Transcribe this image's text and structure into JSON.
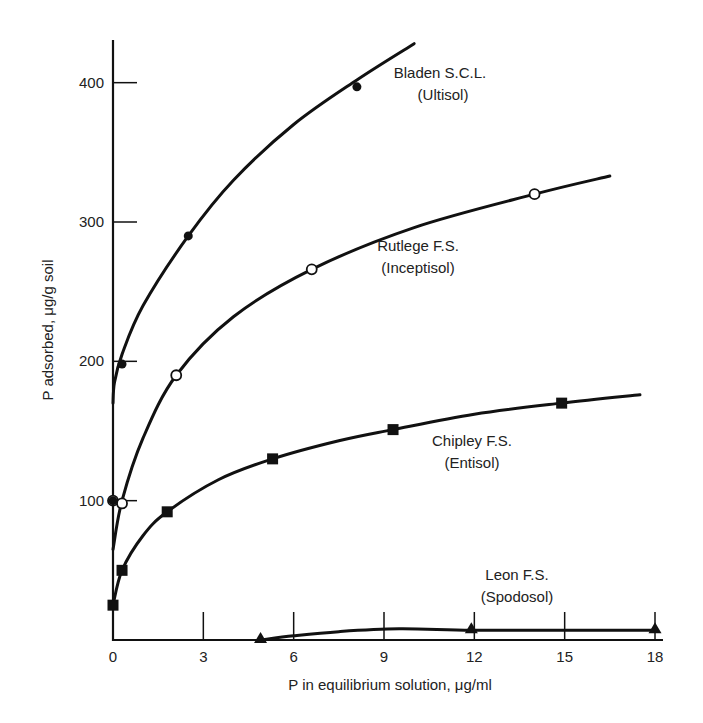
{
  "chart_data": {
    "type": "line",
    "title": "",
    "xlabel": "P in equilibrium solution, μg/ml",
    "ylabel": "P adsorbed, μg/g soil",
    "xlim": [
      0,
      18
    ],
    "ylim": [
      0,
      430
    ],
    "x_ticks": [
      0,
      3,
      6,
      9,
      12,
      15,
      18
    ],
    "y_ticks": [
      100,
      200,
      300,
      400
    ],
    "grid": false,
    "legend": "inline labels next to curves",
    "series": [
      {
        "name": "Bladen S.C.L.",
        "subtitle": "(Ultisol)",
        "marker": "filled-circle",
        "points": [
          [
            0.3,
            198
          ],
          [
            2.5,
            290
          ],
          [
            8.1,
            397
          ]
        ],
        "curve": [
          [
            0,
            170
          ],
          [
            0.05,
            185
          ],
          [
            0.3,
            205
          ],
          [
            1,
            240
          ],
          [
            2.5,
            290
          ],
          [
            4,
            330
          ],
          [
            6,
            370
          ],
          [
            8.1,
            402
          ],
          [
            10,
            428
          ]
        ]
      },
      {
        "name": "Rutlege F.S.",
        "subtitle": "(Inceptisol)",
        "marker": "open-circle",
        "points": [
          [
            0,
            100
          ],
          [
            0.3,
            98
          ],
          [
            2.1,
            190
          ],
          [
            6.6,
            266
          ],
          [
            14,
            320
          ]
        ],
        "curve": [
          [
            0,
            65
          ],
          [
            0.3,
            100
          ],
          [
            1,
            145
          ],
          [
            2.1,
            190
          ],
          [
            4,
            232
          ],
          [
            6.6,
            266
          ],
          [
            10,
            296
          ],
          [
            14,
            320
          ],
          [
            16.5,
            333
          ]
        ]
      },
      {
        "name": "Chipley F.S.",
        "subtitle": "(Entisol)",
        "marker": "filled-square",
        "points": [
          [
            0,
            25
          ],
          [
            0.3,
            50
          ],
          [
            1.8,
            92
          ],
          [
            5.3,
            130
          ],
          [
            9.3,
            151
          ],
          [
            14.9,
            170
          ]
        ],
        "curve": [
          [
            0,
            25
          ],
          [
            0.3,
            50
          ],
          [
            1,
            75
          ],
          [
            1.8,
            92
          ],
          [
            3.5,
            115
          ],
          [
            5.3,
            130
          ],
          [
            7.5,
            143
          ],
          [
            9.3,
            151
          ],
          [
            12,
            162
          ],
          [
            14.9,
            170
          ],
          [
            17.5,
            176
          ]
        ]
      },
      {
        "name": "Leon F.S.",
        "subtitle": "(Spodosol)",
        "marker": "filled-triangle",
        "points": [
          [
            4.9,
            0
          ],
          [
            11.9,
            7
          ],
          [
            18,
            7
          ]
        ],
        "curve": [
          [
            4.9,
            0
          ],
          [
            6,
            3
          ],
          [
            7.5,
            6
          ],
          [
            9.5,
            8
          ],
          [
            11.9,
            7
          ],
          [
            15,
            7
          ],
          [
            18,
            7
          ]
        ]
      }
    ]
  }
}
